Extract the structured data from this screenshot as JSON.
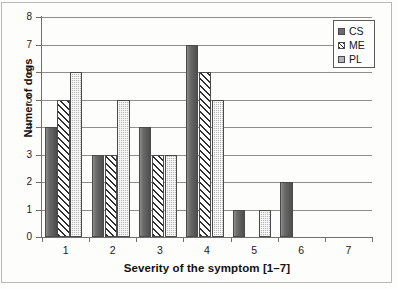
{
  "chart_data": {
    "type": "bar",
    "title": "",
    "xlabel": "Severity of the symptom [1–7]",
    "ylabel": "Numer of dogs",
    "categories": [
      "1",
      "2",
      "3",
      "4",
      "5",
      "6",
      "7"
    ],
    "series": [
      {
        "name": "CS",
        "values": [
          4,
          3,
          4,
          7,
          1,
          2,
          0
        ],
        "pattern": "solid-gray",
        "color": "#6b6b6b"
      },
      {
        "name": "ME",
        "values": [
          5,
          3,
          3,
          6,
          0,
          0,
          0
        ],
        "pattern": "diagonal-hatch",
        "color": "#2e2e2e"
      },
      {
        "name": "PL",
        "values": [
          6,
          5,
          3,
          5,
          1,
          0,
          0
        ],
        "pattern": "checkered-stipple",
        "color": "#b4b4b4"
      }
    ],
    "ylim": [
      0,
      8
    ],
    "yticks": [
      0,
      1,
      2,
      3,
      4,
      5,
      6,
      7,
      8
    ],
    "ytick_labels": [
      "0",
      "1",
      "2",
      "3",
      "4",
      "5",
      "6",
      "7",
      "8"
    ],
    "grid": true,
    "grid_axis": "y",
    "legend_position": "top-right",
    "legend_entries": [
      "CS",
      "ME",
      "PL"
    ]
  },
  "axes": {
    "y_title": "Numer of dogs",
    "x_title": "Severity of the symptom [1–7]"
  },
  "legend": {
    "items": [
      {
        "label": "CS"
      },
      {
        "label": "ME"
      },
      {
        "label": "PL"
      }
    ]
  }
}
